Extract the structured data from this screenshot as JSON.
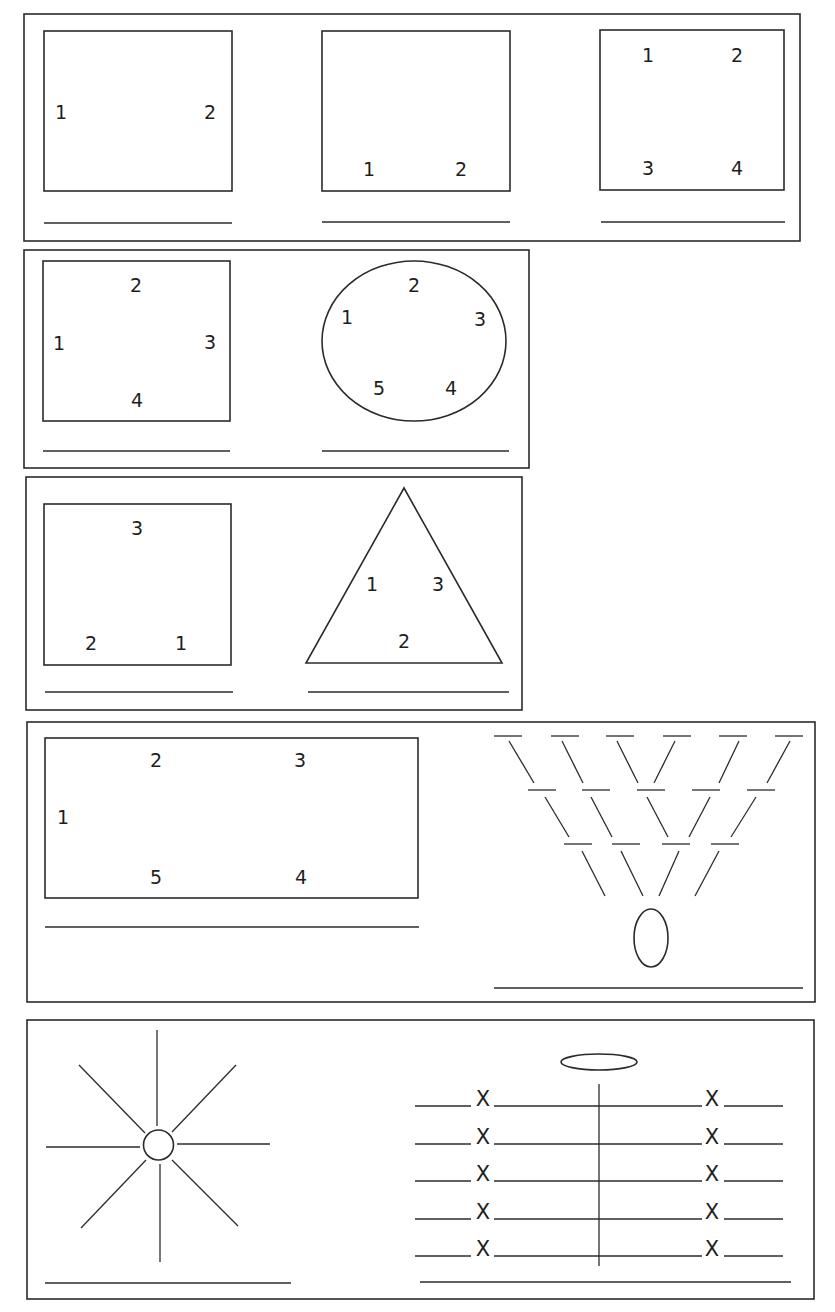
{
  "page": {
    "heading_fragment": "...g ... y ... p",
    "stroke_color": "#2b2b2b",
    "background": "#ffffff"
  },
  "panels": [
    {
      "id": "panel-1",
      "figures": [
        {
          "shape": "square",
          "labels": [
            {
              "text": "1",
              "pos": "left-middle"
            },
            {
              "text": "2",
              "pos": "right-middle"
            }
          ]
        },
        {
          "shape": "square",
          "labels": [
            {
              "text": "1",
              "pos": "bottom-left"
            },
            {
              "text": "2",
              "pos": "bottom-right"
            }
          ]
        },
        {
          "shape": "square",
          "labels": [
            {
              "text": "1",
              "pos": "top-left"
            },
            {
              "text": "2",
              "pos": "top-right"
            },
            {
              "text": "3",
              "pos": "bottom-left"
            },
            {
              "text": "4",
              "pos": "bottom-right"
            }
          ]
        }
      ]
    },
    {
      "id": "panel-2",
      "figures": [
        {
          "shape": "square",
          "labels": [
            {
              "text": "1",
              "pos": "left"
            },
            {
              "text": "2",
              "pos": "top"
            },
            {
              "text": "3",
              "pos": "right"
            },
            {
              "text": "4",
              "pos": "bottom"
            }
          ]
        },
        {
          "shape": "circle",
          "labels": [
            {
              "text": "1"
            },
            {
              "text": "2"
            },
            {
              "text": "3"
            },
            {
              "text": "4"
            },
            {
              "text": "5"
            }
          ]
        }
      ]
    },
    {
      "id": "panel-3",
      "figures": [
        {
          "shape": "square",
          "labels": [
            {
              "text": "3",
              "pos": "top"
            },
            {
              "text": "2",
              "pos": "bottom-left"
            },
            {
              "text": "1",
              "pos": "bottom-right"
            }
          ]
        },
        {
          "shape": "triangle",
          "labels": [
            {
              "text": "1"
            },
            {
              "text": "3"
            },
            {
              "text": "2"
            }
          ]
        }
      ]
    },
    {
      "id": "panel-4",
      "figures": [
        {
          "shape": "rectangle",
          "labels": [
            {
              "text": "1"
            },
            {
              "text": "2"
            },
            {
              "text": "3"
            },
            {
              "text": "4"
            },
            {
              "text": "5"
            }
          ]
        },
        {
          "shape": "v-formation",
          "rows": [
            6,
            5,
            4
          ],
          "target": "ellipse"
        }
      ]
    },
    {
      "id": "panel-5",
      "figures": [
        {
          "shape": "sunburst",
          "rays": 8
        },
        {
          "shape": "rows-with-x",
          "rows": 5,
          "marker": "X",
          "target": "ellipse"
        }
      ]
    }
  ],
  "labels": {
    "p1f1": [
      "1",
      "2"
    ],
    "p1f2": [
      "1",
      "2"
    ],
    "p1f3": [
      "1",
      "2",
      "3",
      "4"
    ],
    "p2f1": [
      "1",
      "2",
      "3",
      "4"
    ],
    "p2f2": [
      "1",
      "2",
      "3",
      "4",
      "5"
    ],
    "p3f1": [
      "1",
      "2",
      "3"
    ],
    "p3f2": [
      "1",
      "2",
      "3"
    ],
    "p4f1": [
      "1",
      "2",
      "3",
      "4",
      "5"
    ],
    "p5_marker": "X"
  }
}
